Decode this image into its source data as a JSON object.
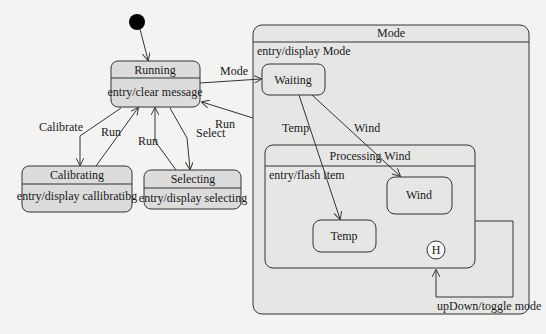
{
  "diagram": {
    "type": "uml-state-machine",
    "initial_state": {
      "target": "Running"
    },
    "states": [
      {
        "id": "running",
        "name": "Running",
        "action": "entry/clear message"
      },
      {
        "id": "calibrating",
        "name": "Calibrating",
        "action": "entry/display callibratibg"
      },
      {
        "id": "selecting",
        "name": "Selecting",
        "action": "entry/display selecting"
      },
      {
        "id": "mode",
        "name": "Mode",
        "action": "entry/display Mode",
        "substates": [
          {
            "id": "waiting",
            "name": "Waiting"
          },
          {
            "id": "processing_wind",
            "name": "Processing Wind",
            "action": "entry/flash item",
            "substates": [
              {
                "id": "wind",
                "name": "Wind"
              },
              {
                "id": "temp",
                "name": "Temp"
              },
              {
                "id": "history",
                "name": "H"
              }
            ]
          }
        ]
      }
    ],
    "transitions": [
      {
        "from": "initial",
        "to": "Running",
        "label": ""
      },
      {
        "from": "Running",
        "to": "Mode",
        "label": "Mode"
      },
      {
        "from": "Mode",
        "to": "Running",
        "label": "Run"
      },
      {
        "from": "Running",
        "to": "Calibrating",
        "label": "Calibrate"
      },
      {
        "from": "Calibrating",
        "to": "Running",
        "label": "Run"
      },
      {
        "from": "Running",
        "to": "Selecting",
        "label": "Select"
      },
      {
        "from": "Selecting",
        "to": "Running",
        "label": "Run"
      },
      {
        "from": "Waiting",
        "to": "Temp",
        "label": "Temp"
      },
      {
        "from": "Waiting",
        "to": "Wind",
        "label": "Wind"
      },
      {
        "from": "Processing Wind",
        "to": "H",
        "label": "upDown/toggle mode"
      }
    ]
  },
  "labels": {
    "running_name": "Running",
    "running_action": "entry/clear message",
    "calibrating_name": "Calibrating",
    "calibrating_action": "entry/display callibratibg",
    "selecting_name": "Selecting",
    "selecting_action": "entry/display selecting",
    "mode_name": "Mode",
    "mode_action": "entry/display Mode",
    "waiting_name": "Waiting",
    "processing_name": "Processing Wind",
    "processing_action": "entry/flash item",
    "wind_name": "Wind",
    "temp_name": "Temp",
    "history_name": "H",
    "t_mode": "Mode",
    "t_run_mode": "Run",
    "t_calibrate": "Calibrate",
    "t_run_cal": "Run",
    "t_select": "Select",
    "t_run_sel": "Run",
    "t_temp": "Temp",
    "t_wind": "Wind",
    "t_updown": "upDown/toggle mode"
  }
}
